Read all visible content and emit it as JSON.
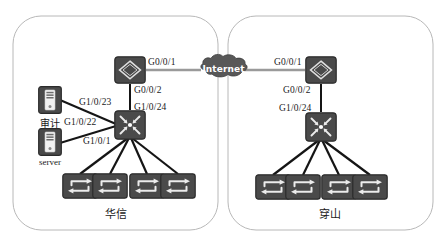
{
  "diagram": {
    "colors": {
      "device_fill": "#4a4a4a",
      "device_stroke": "#2c2c2c",
      "link": "#151515",
      "wan_link": "#9a9a9a",
      "cloud_fill": "#585858",
      "group_border": "#b8b8b8",
      "background": "#ffffff",
      "text": "#1a1a1a",
      "icon_light": "#e8e8e8"
    },
    "groups": [
      {
        "id": "left",
        "label": "华信"
      },
      {
        "id": "right",
        "label": "穿山"
      }
    ],
    "cloud": {
      "label": "Internet"
    },
    "nodes": {
      "left_router": {
        "type": "router",
        "glyph": "R"
      },
      "left_core_switch": {
        "type": "core-switch"
      },
      "left_audit_server": {
        "type": "server",
        "label": "审计"
      },
      "left_server": {
        "type": "server",
        "label": "server"
      },
      "right_router": {
        "type": "router",
        "glyph": "R"
      },
      "right_core_switch": {
        "type": "core-switch"
      }
    },
    "port_labels": {
      "left_router_wan": "G0/0/1",
      "left_router_lan": "G0/0/2",
      "left_core_uplink": "G1/0/24",
      "left_audit_port": "G1/0/23",
      "left_audit_port2": "G1/0/22",
      "left_server_port": "G1/0/1",
      "right_router_wan": "G0/0/1",
      "right_router_lan": "G0/0/2",
      "right_core_uplink": "G1/0/24"
    },
    "access_switches": {
      "left_count": 4,
      "right_count": 4
    }
  }
}
